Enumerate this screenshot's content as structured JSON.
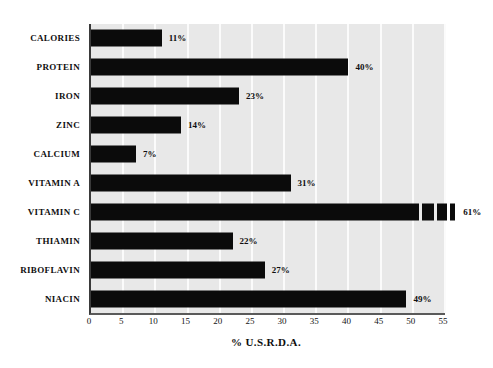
{
  "chart_data": {
    "type": "bar",
    "orientation": "horizontal",
    "title": "",
    "xlabel": "% U.S.R.D.A.",
    "ylabel": "",
    "xlim": [
      0,
      55
    ],
    "xticks": [
      0,
      5,
      10,
      15,
      20,
      25,
      30,
      35,
      40,
      45,
      50,
      55
    ],
    "xtick_labels": [
      "0",
      "5",
      "10",
      "15",
      "20",
      "25",
      "30",
      "35",
      "40",
      "45",
      "50",
      "55"
    ],
    "grid": "vertical-white-gridlines",
    "legend": "none",
    "categories": [
      "CALORIES",
      "PROTEIN",
      "IRON",
      "ZINC",
      "CALCIUM",
      "VITAMIN A",
      "VITAMIN C",
      "THIAMIN",
      "RIBOFLAVIN",
      "NIACIN"
    ],
    "values": [
      11,
      40,
      23,
      14,
      7,
      31,
      61,
      22,
      27,
      49
    ],
    "value_labels": [
      "11%",
      "40%",
      "23%",
      "14%",
      "7%",
      "31%",
      "61%",
      "22%",
      "27%",
      "49%"
    ],
    "colors": {
      "bar": "#0b0b0b",
      "plot_background": "#e8e8e8",
      "gridline": "#fbfbfb",
      "axis": "#3a3a3a",
      "text": "#100f0f",
      "page_background": "#ffffff"
    }
  }
}
